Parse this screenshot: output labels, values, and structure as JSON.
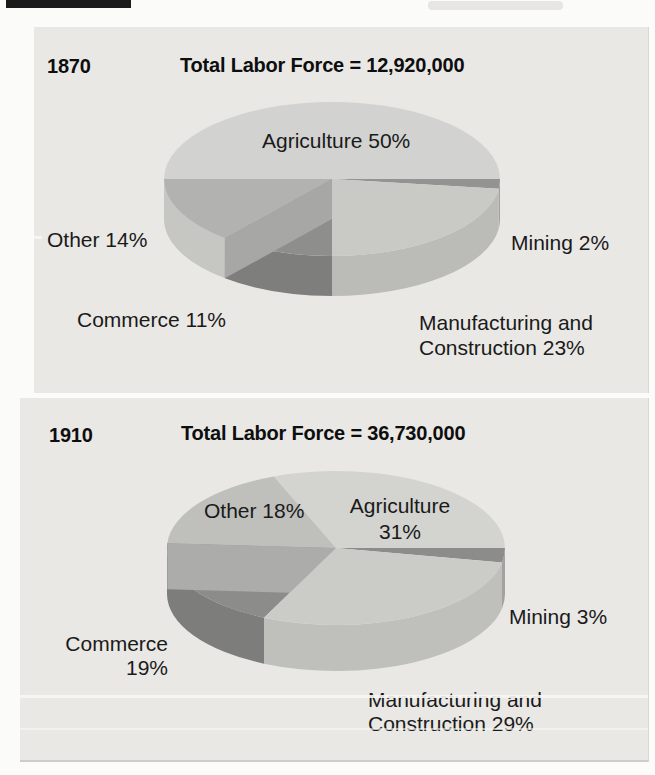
{
  "page": {
    "background": "#fbfbf9",
    "panel_color": "#e9e8e5"
  },
  "chart_data": [
    {
      "type": "pie",
      "year": "1870",
      "title": "Total Labor Force = 12,920,000",
      "categories": [
        "Agriculture",
        "Other",
        "Mining",
        "Commerce",
        "Manufacturing and Construction"
      ],
      "values": [
        50,
        14,
        2,
        11,
        23
      ],
      "unit": "percent",
      "legend_position": "labels-around-pie",
      "geometry": {
        "cx": 332,
        "cy": 179,
        "rx": 168,
        "ry": 77,
        "depth": 40
      },
      "slices": [
        {
          "name": "Agriculture",
          "value": 50,
          "start": 180,
          "end": 360,
          "color": "#d2d2d0",
          "label": {
            "text": "Agriculture 50%"
          }
        },
        {
          "name": "Other",
          "value": 14,
          "start": 129.6,
          "end": 180,
          "color": "#b2b2b0",
          "band": "#c6c6c3",
          "label": {
            "text": "Other 14%"
          }
        },
        {
          "name": "Mining",
          "value": 2,
          "start": 0,
          "end": 7.2,
          "color": "#939391",
          "band": "#a0a09e",
          "label": {
            "text": "Mining 2%"
          }
        },
        {
          "name": "Commerce",
          "value": 11,
          "start": 90,
          "end": 129.6,
          "color": "#8e8e8c",
          "band": "#7e7e7c",
          "walls": [
            {
              "angle": 129.6,
              "color": "#a7a7a5"
            }
          ],
          "label": {
            "text": "Commerce 11%"
          }
        },
        {
          "name": "Manufacturing and Construction",
          "value": 23,
          "start": 7.2,
          "end": 90,
          "color": "#c9c9c6",
          "band": "#bbbbb8",
          "label": {
            "text": "Manufacturing and\nConstruction 23%"
          }
        }
      ]
    },
    {
      "type": "pie",
      "year": "1910",
      "title": "Total Labor Force = 36,730,000",
      "categories": [
        "Agriculture",
        "Other",
        "Mining",
        "Commerce",
        "Manufacturing and Construction"
      ],
      "values": [
        31,
        18,
        3,
        19,
        29
      ],
      "unit": "percent",
      "legend_position": "labels-around-pie",
      "geometry": {
        "cx": 336,
        "cy": 548,
        "rx": 169,
        "ry": 77,
        "depth": 46
      },
      "slices": [
        {
          "name": "Agriculture",
          "value": 31,
          "start": 248.4,
          "end": 360,
          "color": "#d3d3d0",
          "label": {
            "text": "Agriculture\n31%"
          }
        },
        {
          "name": "Other",
          "value": 18,
          "start": 183.6,
          "end": 248.4,
          "color": "#bfbfbc",
          "label": {
            "text": "Other 18%"
          }
        },
        {
          "name": "Mining",
          "value": 3,
          "start": 0,
          "end": 10.8,
          "color": "#8c8c8a",
          "band": "#a2a2a0",
          "label": {
            "text": "Mining 3%"
          }
        },
        {
          "name": "Commerce",
          "value": 19,
          "start": 115.2,
          "end": 183.6,
          "color": "#8c8c8a",
          "band": "#7d7d7b",
          "walls": [
            {
              "angle": 183.6,
              "color": "#acacaa"
            }
          ],
          "label": {
            "text": "Commerce\n19%"
          }
        },
        {
          "name": "Manufacturing and Construction",
          "value": 29,
          "start": 10.8,
          "end": 115.2,
          "color": "#cbcbc8",
          "band": "#bfbfbc",
          "label": {
            "text": "Manufacturing and\nConstruction 29%"
          }
        }
      ]
    }
  ]
}
